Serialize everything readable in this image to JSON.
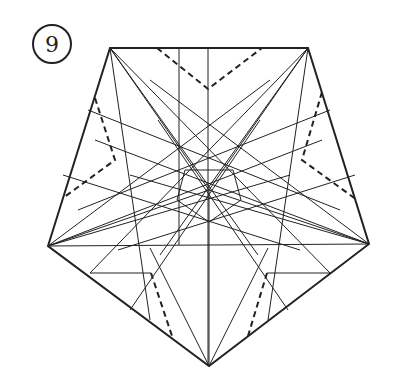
{
  "step": {
    "number": "9"
  },
  "colors": {
    "line": "#222222",
    "background": "#ffffff"
  },
  "outline": [
    [
      110,
      48
    ],
    [
      308,
      48
    ],
    [
      369,
      244
    ],
    [
      209,
      366
    ],
    [
      48,
      246
    ]
  ],
  "center": [
    209,
    190
  ],
  "dashed": [
    [
      [
        157,
        48
      ],
      [
        208,
        89
      ],
      [
        262,
        48
      ]
    ],
    [
      [
        95,
        98
      ],
      [
        115,
        160
      ],
      [
        63,
        198
      ]
    ],
    [
      [
        322,
        92
      ],
      [
        302,
        160
      ],
      [
        357,
        200
      ]
    ],
    [
      [
        151,
        273
      ],
      [
        172,
        336
      ]
    ],
    [
      [
        267,
        273
      ],
      [
        248,
        336
      ]
    ]
  ],
  "creases": [
    [
      [
        110,
        48
      ],
      [
        209,
        190
      ]
    ],
    [
      [
        308,
        48
      ],
      [
        209,
        190
      ]
    ],
    [
      [
        369,
        244
      ],
      [
        209,
        190
      ]
    ],
    [
      [
        209,
        366
      ],
      [
        209,
        190
      ]
    ],
    [
      [
        48,
        246
      ],
      [
        209,
        190
      ]
    ],
    [
      [
        208,
        48
      ],
      [
        208,
        366
      ]
    ],
    [
      [
        179,
        48
      ],
      [
        179,
        245
      ]
    ],
    [
      [
        48,
        246
      ],
      [
        369,
        244
      ]
    ],
    [
      [
        90,
        273
      ],
      [
        151,
        273
      ]
    ],
    [
      [
        267,
        273
      ],
      [
        330,
        273
      ]
    ],
    [
      [
        110,
        48
      ],
      [
        258,
        255
      ]
    ],
    [
      [
        110,
        48
      ],
      [
        150,
        320
      ]
    ],
    [
      [
        110,
        48
      ],
      [
        330,
        273
      ]
    ],
    [
      [
        308,
        48
      ],
      [
        160,
        255
      ]
    ],
    [
      [
        308,
        48
      ],
      [
        268,
        320
      ]
    ],
    [
      [
        308,
        48
      ],
      [
        90,
        273
      ]
    ],
    [
      [
        48,
        246
      ],
      [
        270,
        80
      ]
    ],
    [
      [
        48,
        246
      ],
      [
        322,
        140
      ]
    ],
    [
      [
        48,
        246
      ],
      [
        290,
        175
      ]
    ],
    [
      [
        369,
        244
      ],
      [
        150,
        80
      ]
    ],
    [
      [
        369,
        244
      ],
      [
        95,
        140
      ]
    ],
    [
      [
        369,
        244
      ],
      [
        130,
        175
      ]
    ],
    [
      [
        209,
        366
      ],
      [
        150,
        248
      ]
    ],
    [
      [
        209,
        366
      ],
      [
        268,
        248
      ]
    ],
    [
      [
        63,
        175
      ],
      [
        300,
        250
      ]
    ],
    [
      [
        355,
        175
      ],
      [
        118,
        250
      ]
    ],
    [
      [
        78,
        210
      ],
      [
        330,
        110
      ]
    ],
    [
      [
        340,
        210
      ],
      [
        88,
        110
      ]
    ],
    [
      [
        130,
        310
      ],
      [
        260,
        120
      ]
    ],
    [
      [
        288,
        310
      ],
      [
        158,
        120
      ]
    ],
    [
      [
        185,
        170
      ],
      [
        233,
        170
      ]
    ],
    [
      [
        233,
        170
      ],
      [
        241,
        200
      ]
    ],
    [
      [
        241,
        200
      ],
      [
        209,
        222
      ]
    ],
    [
      [
        209,
        222
      ],
      [
        177,
        200
      ]
    ],
    [
      [
        177,
        200
      ],
      [
        185,
        170
      ]
    ]
  ]
}
